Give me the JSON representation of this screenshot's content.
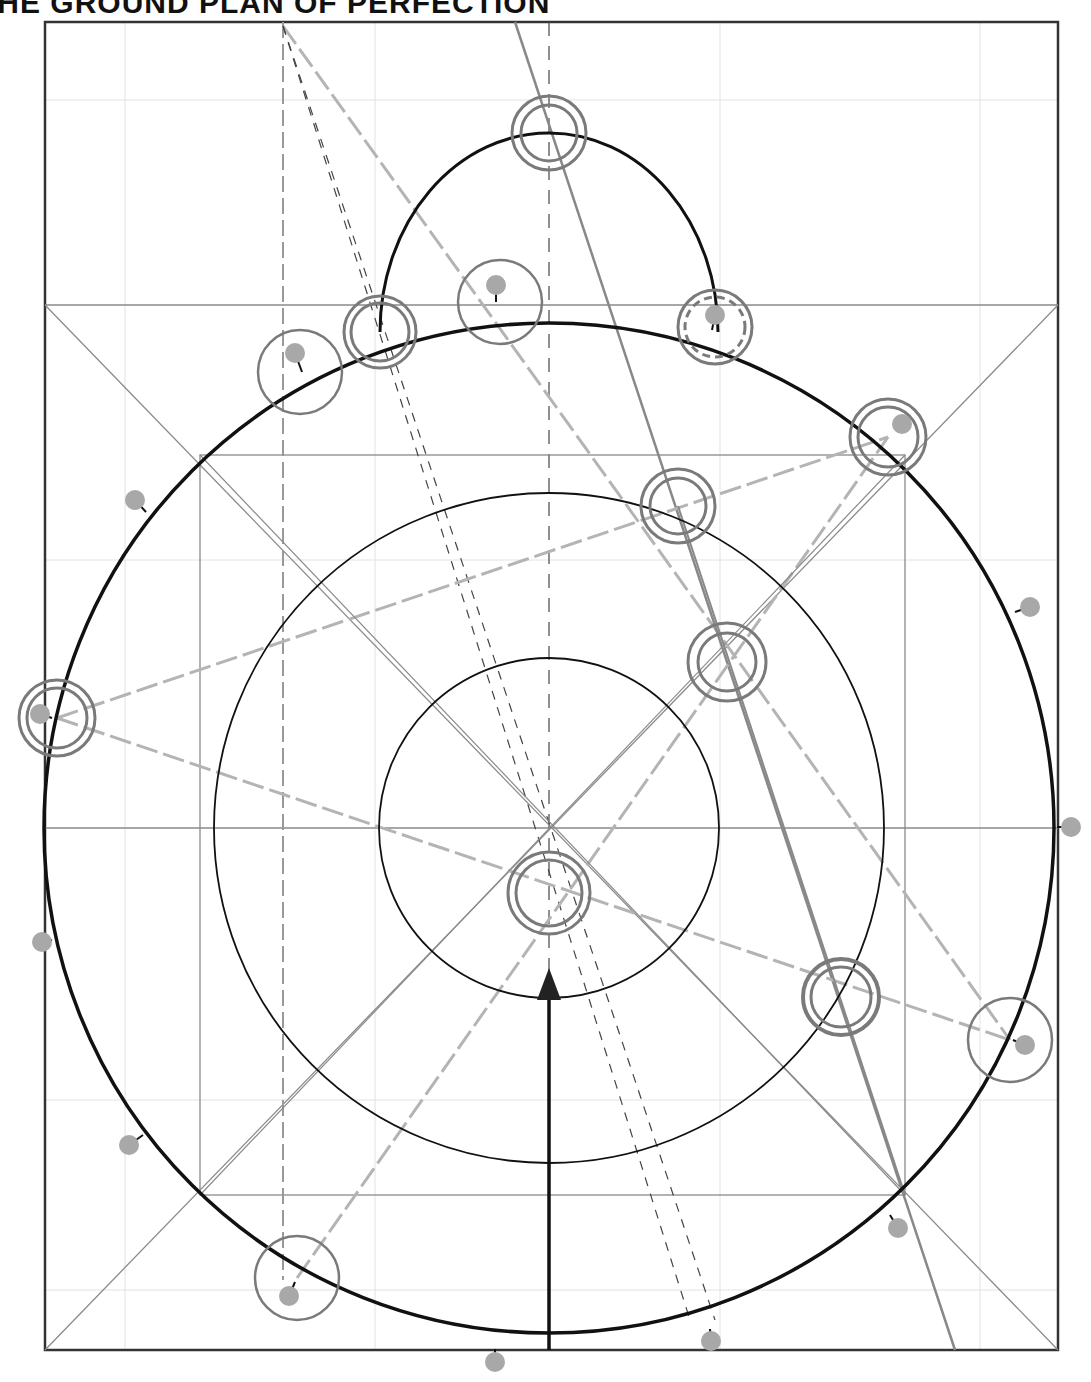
{
  "title": "THE GROUND PLAN OF PERFECTION",
  "colors": {
    "ink": "#111111",
    "grid": "#8a8a8a",
    "faint": "#d8d8d8",
    "marker": "#a8a8a8",
    "ring": "#7a7a7a",
    "dashed_light": "#b4b4b4"
  },
  "geometry": {
    "frame": {
      "x": 45,
      "y": 22,
      "w": 1013,
      "h": 1328
    },
    "square_top_y": 305,
    "inner_square": {
      "x": 200,
      "y": 455,
      "w": 705,
      "h": 740
    },
    "center": {
      "x": 549,
      "y": 828
    },
    "circles": [
      {
        "name": "outer-circle",
        "r": 505
      },
      {
        "name": "middle-circle",
        "r": 335
      },
      {
        "name": "inner-circle",
        "r": 170
      }
    ],
    "semicircle": {
      "cx": 549,
      "cy": 330,
      "r": 169
    }
  },
  "markers": [
    {
      "x": 496,
      "y": 285
    },
    {
      "x": 715,
      "y": 315
    },
    {
      "x": 295,
      "y": 353
    },
    {
      "x": 902,
      "y": 424
    },
    {
      "x": 135,
      "y": 500
    },
    {
      "x": 1030,
      "y": 607
    },
    {
      "x": 40,
      "y": 714
    },
    {
      "x": 1071,
      "y": 827
    },
    {
      "x": 42,
      "y": 942
    },
    {
      "x": 1025,
      "y": 1045
    },
    {
      "x": 129,
      "y": 1145
    },
    {
      "x": 898,
      "y": 1228
    },
    {
      "x": 289,
      "y": 1296
    },
    {
      "x": 711,
      "y": 1341
    },
    {
      "x": 495,
      "y": 1362
    }
  ],
  "rings": [
    {
      "x": 549,
      "y": 133,
      "r1": 37,
      "r2": 28
    },
    {
      "x": 380,
      "y": 332,
      "r1": 36,
      "r2": 29
    },
    {
      "x": 500,
      "y": 302,
      "r1": 42,
      "r2": 0
    },
    {
      "x": 715,
      "y": 327,
      "r1": 37,
      "r2": 30,
      "dashed": true
    },
    {
      "x": 300,
      "y": 372,
      "r1": 42,
      "r2": 0
    },
    {
      "x": 888,
      "y": 437,
      "r1": 38,
      "r2": 30
    },
    {
      "x": 678,
      "y": 506,
      "r1": 37,
      "r2": 28
    },
    {
      "x": 727,
      "y": 662,
      "r1": 39,
      "r2": 29
    },
    {
      "x": 57,
      "y": 718,
      "r1": 38,
      "r2": 30
    },
    {
      "x": 549,
      "y": 893,
      "r1": 41,
      "r2": 33
    },
    {
      "x": 841,
      "y": 997,
      "r1": 38,
      "r2": 30
    },
    {
      "x": 1010,
      "y": 1040,
      "r1": 42,
      "r2": 0
    },
    {
      "x": 297,
      "y": 1278,
      "r1": 42,
      "r2": 0
    }
  ],
  "arrow": {
    "x": 549,
    "y_from": 1350,
    "y_to": 972
  }
}
